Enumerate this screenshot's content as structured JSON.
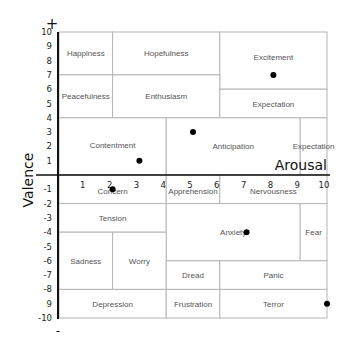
{
  "chart_data": {
    "type": "scatter",
    "title": "",
    "xlabel": "Arousal",
    "ylabel": "Valence",
    "xlim": [
      0,
      10
    ],
    "ylim": [
      -10,
      10
    ],
    "y_top_marker": "+",
    "y_bottom_marker": "-",
    "x_ticks": [
      "1",
      "2",
      "3",
      "4",
      "5",
      "6",
      "7",
      "8",
      "9",
      "10"
    ],
    "y_ticks": [
      "10",
      "9",
      "8",
      "7",
      "6",
      "5",
      "4",
      "3",
      "2",
      "1",
      "-1",
      "-2",
      "-3",
      "-4",
      "-5",
      "-6",
      "-7",
      "-8",
      "9",
      "-10"
    ],
    "regions": [
      {
        "label": "Happiness",
        "x": [
          0,
          2
        ],
        "y": [
          7,
          10
        ]
      },
      {
        "label": "Hopefulness",
        "x": [
          2,
          6
        ],
        "y": [
          7,
          10
        ]
      },
      {
        "label": "Excitement",
        "x": [
          6,
          10
        ],
        "y": [
          6,
          10
        ]
      },
      {
        "label": "Peacefulness",
        "x": [
          0,
          2
        ],
        "y": [
          4,
          7
        ]
      },
      {
        "label": "Enthusiasm",
        "x": [
          2,
          6
        ],
        "y": [
          4,
          7
        ]
      },
      {
        "label": "Expectation",
        "x": [
          6,
          10
        ],
        "y": [
          4,
          6
        ]
      },
      {
        "label": "Contentment",
        "x": [
          0,
          4
        ],
        "y": [
          0,
          4
        ]
      },
      {
        "label": "Anticipation",
        "x": [
          4,
          9
        ],
        "y": [
          0,
          4
        ]
      },
      {
        "label": "Expectation",
        "x": [
          9,
          10
        ],
        "y": [
          0,
          4
        ]
      },
      {
        "label": "Concern",
        "x": [
          0,
          4
        ],
        "y": [
          -2,
          0
        ]
      },
      {
        "label": "Apprehension",
        "x": [
          4,
          6
        ],
        "y": [
          -2,
          0
        ]
      },
      {
        "label": "Nervousness",
        "x": [
          6,
          10
        ],
        "y": [
          -2,
          0
        ]
      },
      {
        "label": "Tension",
        "x": [
          0,
          4
        ],
        "y": [
          -4,
          -2
        ]
      },
      {
        "label": "Anxiety",
        "x": [
          4,
          9
        ],
        "y": [
          -6,
          -2
        ]
      },
      {
        "label": "Fear",
        "x": [
          9,
          10
        ],
        "y": [
          -6,
          -2
        ]
      },
      {
        "label": "Sadness",
        "x": [
          0,
          2
        ],
        "y": [
          -8,
          -4
        ]
      },
      {
        "label": "Worry",
        "x": [
          2,
          4
        ],
        "y": [
          -8,
          -4
        ]
      },
      {
        "label": "Dread",
        "x": [
          4,
          6
        ],
        "y": [
          -8,
          -6
        ]
      },
      {
        "label": "Panic",
        "x": [
          6,
          10
        ],
        "y": [
          -8,
          -6
        ]
      },
      {
        "label": "Depression",
        "x": [
          0,
          4
        ],
        "y": [
          -10,
          -8
        ]
      },
      {
        "label": "Frustration",
        "x": [
          4,
          6
        ],
        "y": [
          -10,
          -8
        ]
      },
      {
        "label": "Terror",
        "x": [
          6,
          10
        ],
        "y": [
          -10,
          -8
        ]
      }
    ],
    "points": [
      {
        "x": 8,
        "y": 7
      },
      {
        "x": 5,
        "y": 3
      },
      {
        "x": 3,
        "y": 1
      },
      {
        "x": 2,
        "y": -1
      },
      {
        "x": 7,
        "y": -4
      },
      {
        "x": 10,
        "y": -9
      }
    ],
    "grid": false,
    "legend": "none"
  }
}
